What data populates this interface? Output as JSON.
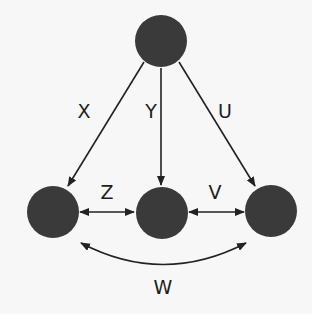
{
  "diagram": {
    "type": "directed graph",
    "colors": {
      "background": "#f7f7f7",
      "node": "#3a3a3a",
      "edge": "#222222"
    },
    "nodes": [
      {
        "id": "top",
        "cx": 161,
        "cy": 41,
        "r": 26
      },
      {
        "id": "left",
        "cx": 53,
        "cy": 212,
        "r": 26
      },
      {
        "id": "middle",
        "cx": 162,
        "cy": 213,
        "r": 26
      },
      {
        "id": "right",
        "cx": 271,
        "cy": 211,
        "r": 26
      }
    ],
    "edges": [
      {
        "label": "X",
        "from": "top",
        "to": "left",
        "direction": "one-way"
      },
      {
        "label": "Y",
        "from": "top",
        "to": "middle",
        "direction": "one-way"
      },
      {
        "label": "U",
        "from": "top",
        "to": "right",
        "direction": "one-way"
      },
      {
        "label": "Z",
        "from": "left",
        "to": "middle",
        "direction": "two-way"
      },
      {
        "label": "V",
        "from": "middle",
        "to": "right",
        "direction": "two-way"
      },
      {
        "label": "W",
        "from": "left",
        "to": "right",
        "direction": "two-way",
        "curved": true
      }
    ],
    "labels": {
      "x": "X",
      "y": "Y",
      "u": "U",
      "z": "Z",
      "v": "V",
      "w": "W"
    }
  }
}
